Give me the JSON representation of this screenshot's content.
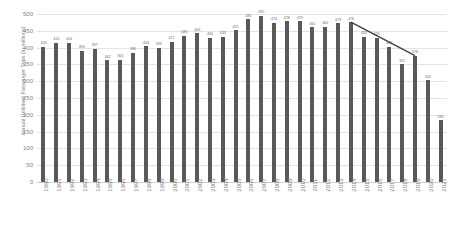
{
  "chart_data": {
    "type": "bar",
    "title": "",
    "xlabel": "",
    "ylabel": "Annual Unlinked Passenger Trips (in millions)",
    "ylim": [
      0,
      500
    ],
    "ytick_step": 50,
    "yticks": [
      "0",
      "50",
      "100",
      "150",
      "200",
      "250",
      "300",
      "350",
      "400",
      "450",
      "500"
    ],
    "grid": true,
    "legend": "none",
    "bar_color": "#595959",
    "gridline_color": "#e4e4e4",
    "label_color": "#7f7f7f",
    "trendline_color": "#404040",
    "trendline_span": [
      "2014",
      "2019"
    ],
    "categories": [
      "1990",
      "1991",
      "1992",
      "1993",
      "1994",
      "1995",
      "1996",
      "1997",
      "1998",
      "1999",
      "2000",
      "2001",
      "2002",
      "2003",
      "2004",
      "2005",
      "2006",
      "2007",
      "2008",
      "2009",
      "2010",
      "2011",
      "2012",
      "2013",
      "2014",
      "2015",
      "2016",
      "2017",
      "2018",
      "2019",
      "2020",
      "2021"
    ],
    "values": [
      403,
      414,
      414,
      390,
      397,
      362,
      364,
      384,
      404,
      399,
      417,
      436,
      443,
      430,
      433,
      452,
      485,
      495,
      474,
      478,
      479,
      461,
      462,
      473,
      476,
      433,
      429,
      403,
      351,
      376,
      303,
      184
    ]
  }
}
